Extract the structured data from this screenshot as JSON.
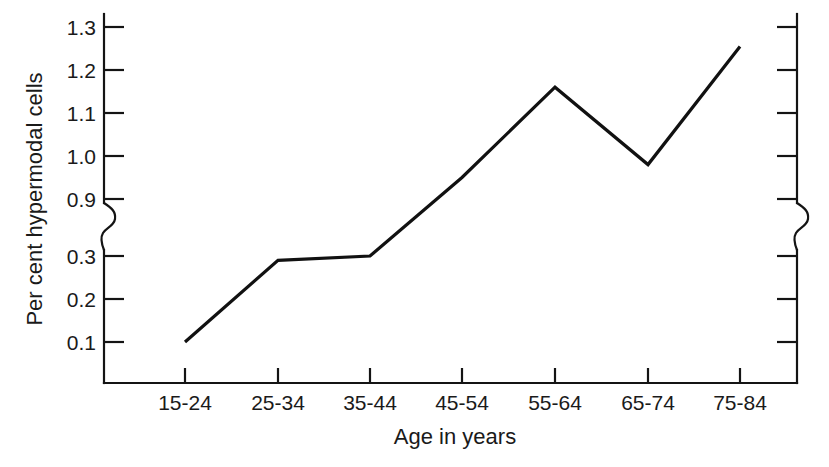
{
  "chart_data": {
    "type": "line",
    "title": "",
    "xlabel": "Age in years",
    "ylabel": "Per cent hypermodal cells",
    "categories": [
      "15-24",
      "25-34",
      "35-44",
      "45-54",
      "55-64",
      "65-74",
      "75-84"
    ],
    "values": [
      0.1,
      0.29,
      0.3,
      0.95,
      1.16,
      0.98,
      1.255
    ],
    "series": [
      {
        "name": "Per cent hypermodal cells",
        "values": [
          0.1,
          0.29,
          0.3,
          0.95,
          1.16,
          0.98,
          1.255
        ]
      }
    ],
    "ytick_labels": [
      "1.3",
      "1.2",
      "1.1",
      "1.0",
      "0.9",
      "0.3",
      "0.2",
      "0.1"
    ],
    "ytick_values": [
      1.3,
      1.2,
      1.1,
      1.0,
      0.9,
      0.3,
      0.2,
      0.1
    ],
    "xtick_labels": [
      "15-24",
      "25-34",
      "35-44",
      "45-54",
      "55-64",
      "65-74",
      "75-84"
    ],
    "y_axis_break": {
      "between": [
        0.9,
        0.3
      ],
      "style": "zigzag",
      "present_on": [
        "left-axis",
        "right-axis"
      ]
    },
    "ylim_lower": [
      0.05,
      0.9
    ],
    "ylim_upper": [
      0.9,
      1.35
    ],
    "grid": false,
    "legend": null,
    "legend_position": "none",
    "line_color": "#111111",
    "background_color": "#ffffff",
    "markers": false
  },
  "axes": {
    "y_label": "Per cent hypermodal cells",
    "x_label": "Age in years",
    "y_ticks": [
      {
        "label": "1.3",
        "y": 27
      },
      {
        "label": "1.2",
        "y": 70
      },
      {
        "label": "1.1",
        "y": 113
      },
      {
        "label": "1.0",
        "y": 156
      },
      {
        "label": "0.9",
        "y": 199
      },
      {
        "label": "0.3",
        "y": 256
      },
      {
        "label": "0.2",
        "y": 299
      },
      {
        "label": "0.1",
        "y": 342
      }
    ],
    "x_ticks": [
      {
        "label": "15-24",
        "x": 185
      },
      {
        "label": "25-34",
        "x": 278
      },
      {
        "label": "35-44",
        "x": 370
      },
      {
        "label": "45-54",
        "x": 462
      },
      {
        "label": "55-64",
        "x": 555
      },
      {
        "label": "65-74",
        "x": 648
      },
      {
        "label": "75-84",
        "x": 740
      }
    ]
  },
  "geometry": {
    "line_path": "M185,342 L278,258 L370,255 L462,185 L555,88 L648,168 L740,47",
    "left_spine_upper": "M104,14 L104,203",
    "left_spine_lower": "M104,250 L104,383",
    "right_spine_upper": "M797,14 L797,203",
    "right_spine_lower": "M797,250 L797,383",
    "bottom_spine": "M104,383 L797,383"
  }
}
